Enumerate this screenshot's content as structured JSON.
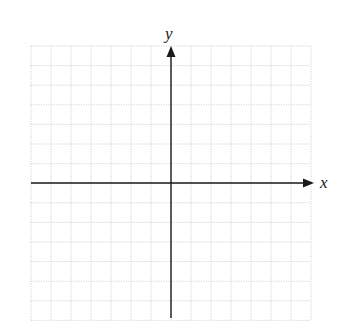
{
  "diagram": {
    "type": "coordinate-plane",
    "grid": {
      "columns": 14,
      "rows": 14,
      "left": 31,
      "top": 46,
      "cell_width": 20,
      "cell_height": 19.6,
      "line_color": "#c8c8c8",
      "style": "dotted"
    },
    "origin": {
      "x": 171,
      "y": 183
    },
    "axes": {
      "x": {
        "label": "x",
        "from": 31,
        "to": 314,
        "arrow": "right"
      },
      "y": {
        "label": "y",
        "from": 318,
        "to": 46,
        "arrow": "up"
      },
      "color": "#1a1a1a"
    }
  }
}
